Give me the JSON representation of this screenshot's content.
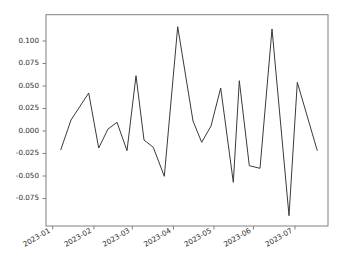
{
  "chart_data": {
    "type": "line",
    "title": "",
    "xlabel": "",
    "ylabel": "",
    "xlim": [
      "2023-01-01",
      "2023-07-20"
    ],
    "ylim": [
      -0.1035,
      0.1235
    ],
    "grid": false,
    "legend": null,
    "yticks": [
      0.1,
      0.075,
      0.05,
      0.025,
      0.0,
      -0.025,
      -0.05,
      -0.075
    ],
    "ytick_labels": [
      "0.100",
      "0.075",
      "0.050",
      "0.025",
      "0.000",
      "-0.025",
      "-0.050",
      "-0.075"
    ],
    "xticks": [
      "2023-01-01",
      "2023-02-01",
      "2023-03-01",
      "2023-04-01",
      "2023-05-01",
      "2023-06-01",
      "2023-07-01"
    ],
    "xtick_labels": [
      "2023-01",
      "2023-02",
      "2023-03",
      "2023-04",
      "2023-05",
      "2023-06",
      "2023-07"
    ],
    "line_color": "#3a3a3a",
    "x": [
      "2023-01-08",
      "2023-01-13",
      "2023-01-19",
      "2023-01-24",
      "2023-01-29",
      "2023-02-03",
      "2023-02-08",
      "2023-02-14",
      "2023-02-19",
      "2023-02-24",
      "2023-03-01",
      "2023-03-06",
      "2023-03-12",
      "2023-03-19",
      "2023-03-25",
      "2023-03-31",
      "2023-04-05",
      "2023-04-14",
      "2023-04-24",
      "2023-05-01",
      "2023-05-07",
      "2023-05-13",
      "2023-05-17",
      "2023-05-22",
      "2023-05-26",
      "2023-05-31",
      "2023-06-04",
      "2023-06-09",
      "2023-06-14",
      "2023-06-21",
      "2023-06-27",
      "2023-07-03",
      "2023-07-10",
      "2023-07-17"
    ],
    "y": [
      -0.0207,
      0.0122,
      0.0422,
      -0.0191,
      0.0021,
      0.0096,
      -0.0219,
      0.0616,
      -0.0102,
      -0.0179,
      -0.0504,
      0.1159,
      0.0819,
      0.0478,
      -0.0126,
      0.0478,
      -0.0572,
      0.0561,
      -0.0386,
      -0.0414,
      0.1133,
      -0.0941,
      0.054,
      -0.0222,
      0.0,
      0.0,
      0.0,
      0.0,
      0.0,
      0.0,
      0.0,
      0.0,
      0.0,
      0.0
    ],
    "points_px": [
      [
        60.7,
        150.0
      ],
      [
        71.0,
        120.0
      ],
      [
        88.7,
        93.0
      ],
      [
        98.7,
        148.0
      ],
      [
        108.0,
        129.0
      ],
      [
        117.0,
        122.3
      ],
      [
        127.0,
        150.7
      ],
      [
        136.0,
        75.7
      ],
      [
        144.0,
        140.0
      ],
      [
        153.3,
        147.3
      ],
      [
        164.3,
        176.3
      ],
      [
        177.7,
        26.7
      ],
      [
        193.0,
        121.0
      ],
      [
        201.7,
        142.3
      ],
      [
        211.0,
        126.0
      ],
      [
        220.7,
        88.0
      ],
      [
        233.3,
        182.3
      ],
      [
        239.3,
        80.7
      ],
      [
        249.3,
        165.7
      ],
      [
        260.0,
        168.3
      ],
      [
        272.0,
        29.0
      ],
      [
        289.0,
        215.7
      ],
      [
        297.3,
        82.3
      ],
      [
        317.3,
        150.7
      ]
    ]
  },
  "axes": {
    "left_px": 46,
    "right_px": 328,
    "top_px": 14.7,
    "bottom_px": 226,
    "zero_y_px": 131,
    "units_per_pixel": 0.001111
  }
}
